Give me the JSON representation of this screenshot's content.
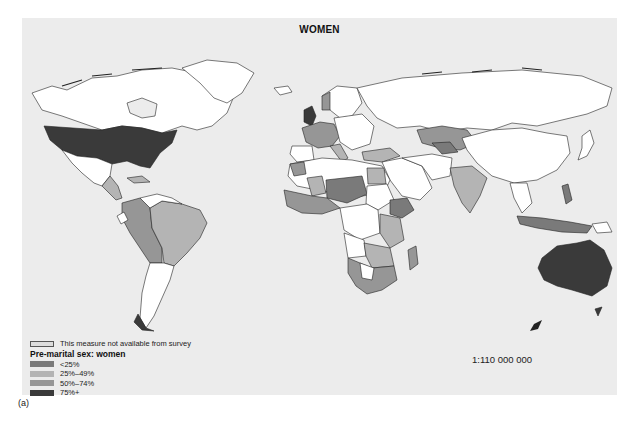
{
  "map": {
    "title": "WOMEN",
    "scale": "1:110 000 000",
    "caption": "(a)",
    "background_color": "#ececec"
  },
  "legend": {
    "not_available": {
      "label": "This measure not available from survey",
      "color": "#dcdcdc"
    },
    "title": "Pre-marital sex: women",
    "items": [
      {
        "label": "<25%",
        "color": "#7a7a7a"
      },
      {
        "label": "25%–49%",
        "color": "#b4b4b4"
      },
      {
        "label": "50%–74%",
        "color": "#969696"
      },
      {
        "label": "75%+",
        "color": "#3a3a3a"
      }
    ],
    "no_data_color": "#ffffff"
  }
}
